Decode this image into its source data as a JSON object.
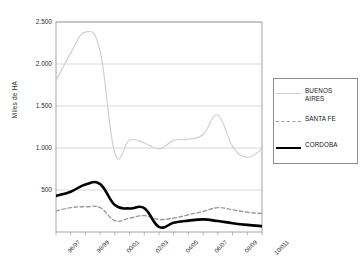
{
  "chart_data": {
    "type": "line",
    "title": "",
    "subtitle": "",
    "xlabel": "",
    "ylabel": "Miles de HA",
    "ylim": [
      0,
      2500
    ],
    "yticks": [
      2500,
      2000,
      1500,
      1000,
      500
    ],
    "ytick_labels": [
      "2.500",
      "2.000",
      "1.500",
      "1.000",
      "500"
    ],
    "grid": true,
    "grid_axis": "y",
    "legend_position": "right-outside",
    "x": [
      "96/97",
      "97/98",
      "98/99",
      "99/00",
      "00/01",
      "01/02",
      "02/03",
      "03/04",
      "04/05",
      "05/06",
      "06/07",
      "07/08",
      "08/09",
      "09/10",
      "10/011"
    ],
    "xtick_labels": [
      "96/97",
      "98/99",
      "00/01",
      "02/03",
      "04/05",
      "06/07",
      "08/09",
      "10/011"
    ],
    "xtick_indices": [
      0,
      2,
      4,
      6,
      8,
      10,
      12,
      14
    ],
    "series": [
      {
        "name": "BUENOS AIRES",
        "legend_label": "BUENOS\nAIRES",
        "color": "#d0d0d0",
        "style": "solid",
        "width": 1.2,
        "values": [
          1800,
          2130,
          2380,
          2150,
          940,
          1095,
          1060,
          990,
          1090,
          1105,
          1160,
          1390,
          1020,
          890,
          990
        ]
      },
      {
        "name": "SANTA FE",
        "legend_label": "SANTA FE",
        "color": "#9a9a9a",
        "style": "dashed",
        "width": 1.4,
        "values": [
          250,
          290,
          300,
          290,
          135,
          165,
          195,
          150,
          165,
          205,
          245,
          290,
          265,
          235,
          220
        ]
      },
      {
        "name": "CORDOBA",
        "legend_label": "CORDOBA",
        "color": "#000000",
        "style": "solid",
        "width": 2.6,
        "values": [
          430,
          480,
          565,
          570,
          320,
          280,
          285,
          60,
          110,
          135,
          150,
          130,
          105,
          85,
          70
        ]
      }
    ]
  }
}
